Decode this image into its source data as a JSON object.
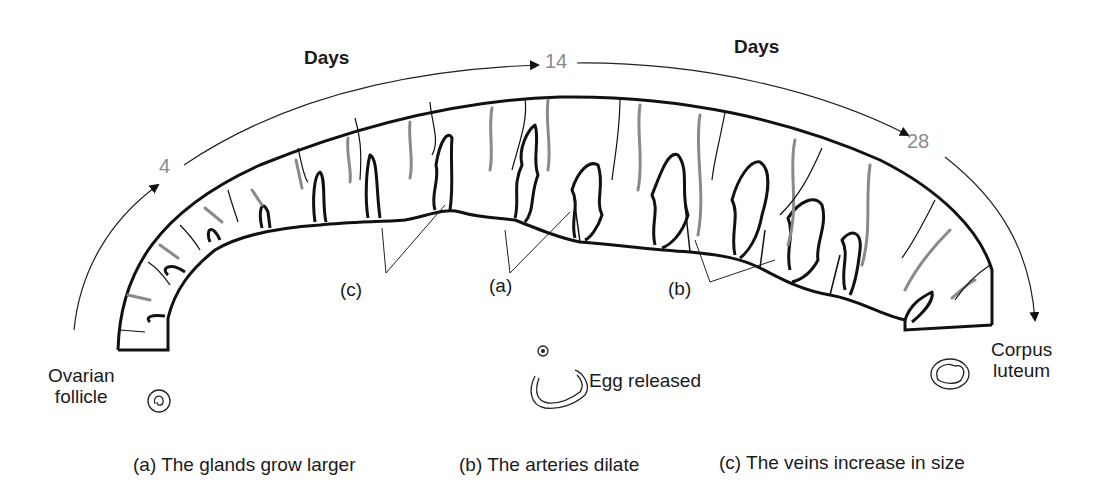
{
  "diagram": {
    "type": "menstrual-cycle-endometrium",
    "timeline": {
      "left_label": "Days",
      "right_label": "Days",
      "day_markers": [
        "4",
        "14",
        "28"
      ]
    },
    "stages": {
      "start": {
        "line1": "Ovarian",
        "line2": "follicle"
      },
      "middle": {
        "label": "Egg released"
      },
      "end": {
        "line1": "Corpus",
        "line2": "luteum"
      }
    },
    "pointer_labels": {
      "c": "(c)",
      "a": "(a)",
      "b": "(b)"
    },
    "legend": [
      {
        "key": "a",
        "text": "(a) The glands grow larger"
      },
      {
        "key": "b",
        "text": "(b) The arteries dilate"
      },
      {
        "key": "c",
        "text": "(c) The veins increase in size"
      }
    ],
    "colors": {
      "ink": "#111111",
      "artery_gray": "#8a8a8a",
      "day_number_gray": "#8a8a8a"
    }
  }
}
